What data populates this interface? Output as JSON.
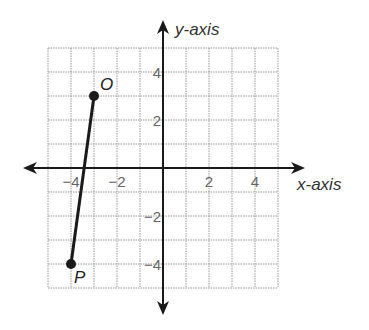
{
  "chart_data": {
    "type": "line",
    "title": "",
    "xlabel": "x-axis",
    "ylabel": "y-axis",
    "xlim": [
      -5,
      5
    ],
    "ylim": [
      -5,
      5
    ],
    "grid": true,
    "x_ticks": [
      -4,
      -2,
      2,
      4
    ],
    "y_ticks": [
      4,
      2,
      -2,
      -4
    ],
    "x_tick_labels": [
      "−4",
      "−2",
      "2",
      "4"
    ],
    "y_tick_labels": [
      "4",
      "2",
      "−2",
      "−4"
    ],
    "series": [
      {
        "name": "segment OP",
        "points": [
          {
            "label": "O",
            "x": -3,
            "y": 3
          },
          {
            "label": "P",
            "x": -4,
            "y": -4
          }
        ]
      }
    ],
    "colors": {
      "grid": "#9a9a9a",
      "axis": "#1a1a1a",
      "segment": "#1a1a1a"
    }
  }
}
